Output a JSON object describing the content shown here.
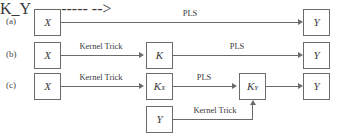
{
  "figure": {
    "background_color": "#ffffff",
    "line_color": "#6b6b6b",
    "text_color": "#3a3a3a"
  },
  "rows": [
    {
      "caption": "(a)"
    },
    {
      "caption": "(b)"
    },
    {
      "caption": "(c)"
    }
  ],
  "nodes": {
    "a_x": {
      "base": "X",
      "sub": ""
    },
    "a_y": {
      "base": "Y",
      "sub": ""
    },
    "b_x": {
      "base": "X",
      "sub": ""
    },
    "b_k": {
      "base": "K",
      "sub": ""
    },
    "b_y": {
      "base": "Y",
      "sub": ""
    },
    "c_x": {
      "base": "X",
      "sub": ""
    },
    "c_kx": {
      "base": "K",
      "sub": "X"
    },
    "c_ky": {
      "base": "K",
      "sub": "Y"
    },
    "c_y_in": {
      "base": "Y",
      "sub": ""
    },
    "c_y": {
      "base": "Y",
      "sub": ""
    }
  },
  "edges": {
    "a_pls": "PLS",
    "b_kernel_trick": "Kernel Trick",
    "b_pls": "PLS",
    "c_kernel_trick": "Kernel Trick",
    "c_pls": "PLS",
    "c_kernel_trick_y": "Kernel Trick"
  }
}
